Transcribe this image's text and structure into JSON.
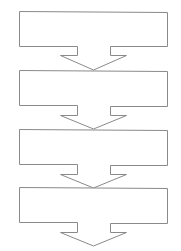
{
  "diagram": {
    "type": "flowchart-vertical",
    "stroke_color": "#8a8a8a",
    "fill_color": "#ffffff",
    "steps": [
      {
        "label": ""
      },
      {
        "label": ""
      },
      {
        "label": ""
      },
      {
        "label": ""
      }
    ]
  }
}
